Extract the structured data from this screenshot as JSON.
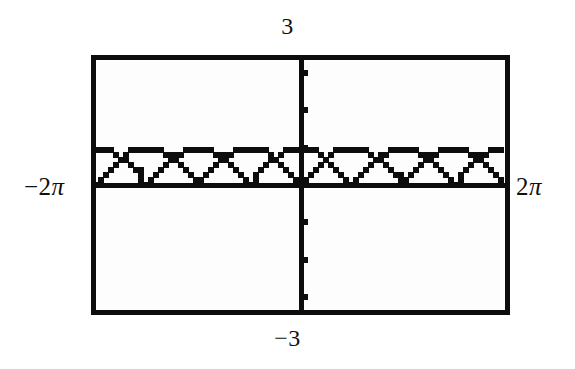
{
  "figure": {
    "kind": "graphing-calculator-screen",
    "background_color": "#fdfdfd",
    "ink_color": "#0d0d0d",
    "frame": {
      "x": 91,
      "y": 55,
      "width": 419,
      "height": 260,
      "border_px": 5
    }
  },
  "labels": {
    "ymax": "3",
    "ymin": "−3",
    "xmin_sign": "−",
    "xmin_number": "2",
    "xmin_symbol": "π",
    "xmax_number": "2",
    "xmax_symbol": "π"
  },
  "chart_data": {
    "type": "line",
    "title": "",
    "xlabel": "",
    "ylabel": "",
    "xlim": [
      -6.283185307,
      6.283185307
    ],
    "ylim": [
      -3,
      3
    ],
    "xlim_labels": [
      "−2π",
      "2π"
    ],
    "ylim_labels": [
      "−3",
      "3"
    ],
    "grid": false,
    "legend": "none",
    "axes": {
      "x_axis_visible": true,
      "y_axis_visible": true,
      "x_axis_y_value": 0,
      "y_axis_x_value": 0,
      "y_tick_values": [
        -3,
        -2,
        -1,
        1,
        2,
        3
      ],
      "y_tick_length_px": 9,
      "x_tick_values": [],
      "pixelated_plot": true,
      "pixel_step_px": 5
    },
    "series": [
      {
        "name": "|sin(x)|",
        "expression": "y = abs(sin(x))",
        "color": "#0d0d0d",
        "amplitude": 1,
        "period": 3.141592653,
        "arch_count": 8,
        "peak_value": 1,
        "min_value": 0
      },
      {
        "name": "|cos(x)|",
        "expression": "y = abs(cos(x))",
        "color": "#0d0d0d",
        "amplitude": 1,
        "period": 3.141592653,
        "arch_count": 9,
        "peak_value": 1,
        "min_value": 0
      }
    ],
    "annotations": [
      {
        "text": "3",
        "position": "above-frame-center"
      },
      {
        "text": "−3",
        "position": "below-frame-center"
      },
      {
        "text": "−2π",
        "position": "left-of-frame"
      },
      {
        "text": "2π",
        "position": "right-of-frame"
      }
    ]
  }
}
